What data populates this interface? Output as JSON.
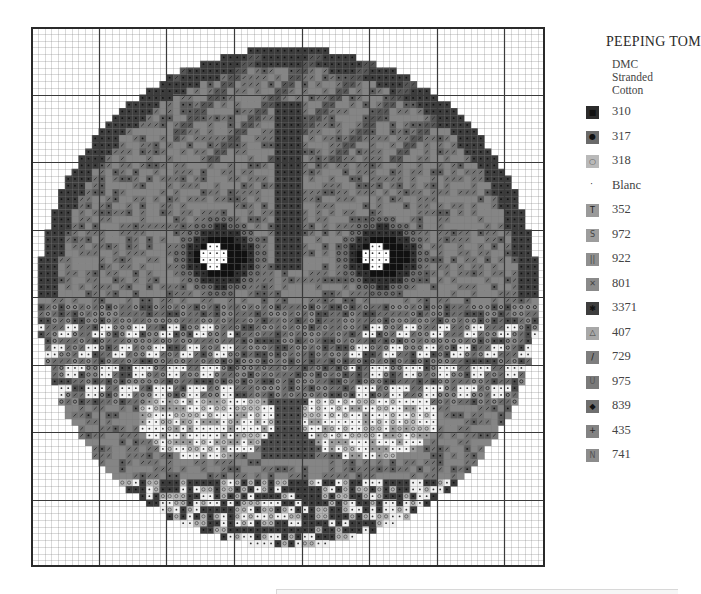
{
  "title": "PEEPING TOM",
  "subtitle_lines": [
    "DMC",
    "Stranded",
    "Cotton"
  ],
  "legend": [
    {
      "code": "310",
      "symbol": "■",
      "swatch": "#2b2b2b",
      "fg": "#111111"
    },
    {
      "code": "317",
      "symbol": "●",
      "swatch": "#6a6a6a",
      "fg": "#111111"
    },
    {
      "code": "318",
      "symbol": "○",
      "swatch": "#b9b9b9",
      "fg": "#555555"
    },
    {
      "code": "Blanc",
      "symbol": "·",
      "swatch": "#ffffff",
      "fg": "#222222"
    },
    {
      "code": "352",
      "symbol": "T",
      "swatch": "#9a9a9a",
      "fg": "#222222"
    },
    {
      "code": "972",
      "symbol": "S",
      "swatch": "#9d9d9d",
      "fg": "#444444"
    },
    {
      "code": "922",
      "symbol": "||",
      "swatch": "#8f8f8f",
      "fg": "#444444"
    },
    {
      "code": "801",
      "symbol": "✕",
      "swatch": "#8a8a8a",
      "fg": "#444444"
    },
    {
      "code": "3371",
      "symbol": "✱",
      "swatch": "#3e3e3e",
      "fg": "#111111"
    },
    {
      "code": "407",
      "symbol": "△",
      "swatch": "#a8a8a8",
      "fg": "#444444"
    },
    {
      "code": "729",
      "symbol": "/",
      "swatch": "#7e7e7e",
      "fg": "#111111"
    },
    {
      "code": "975",
      "symbol": "U",
      "swatch": "#7a7a7a",
      "fg": "#555555"
    },
    {
      "code": "839",
      "symbol": "◆",
      "swatch": "#6f6f6f",
      "fg": "#111111"
    },
    {
      "code": "435",
      "symbol": "+",
      "swatch": "#838383",
      "fg": "#222222"
    },
    {
      "code": "741",
      "symbol": "N",
      "swatch": "#8c8c8c",
      "fg": "#555555"
    }
  ],
  "chart_data": {
    "type": "heatmap",
    "title": "PEEPING TOM",
    "subtitle": "DMC Stranded Cotton",
    "grid": {
      "columns": 76,
      "rows": 80,
      "major_every": 10,
      "cell_px": 6.76
    },
    "circle": {
      "center_col": 38,
      "center_row": 40,
      "radius_cells": 37
    },
    "features": {
      "left_eye": {
        "col": 28,
        "row": 34,
        "radius": 6,
        "pupil": [
          27,
          34
        ]
      },
      "right_eye": {
        "col": 52,
        "row": 34,
        "radius": 6,
        "pupil": [
          51,
          34
        ]
      },
      "nose": {
        "col": 38,
        "row": 56
      },
      "whisker_rows": [
        44,
        47,
        50,
        53
      ],
      "muzzle_left": {
        "col": 26,
        "row": 58
      },
      "muzzle_right": {
        "col": 50,
        "row": 58
      }
    },
    "thread_codes": [
      "310",
      "317",
      "318",
      "Blanc",
      "352",
      "972",
      "922",
      "801",
      "3371",
      "407",
      "729",
      "975",
      "839",
      "435",
      "741"
    ],
    "grid_on": true
  }
}
